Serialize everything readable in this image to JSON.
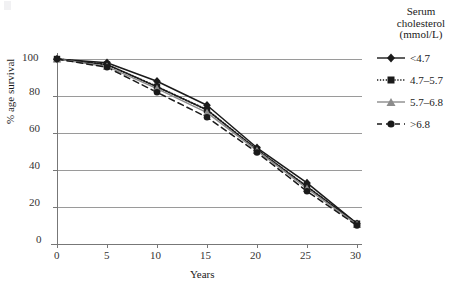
{
  "chart_data": {
    "type": "line",
    "title": "",
    "subtitle": "",
    "xlabel": "Years",
    "ylabel": "% age survival",
    "x": [
      0,
      5,
      10,
      15,
      20,
      25,
      30
    ],
    "xlim": [
      0,
      30
    ],
    "ylim": [
      0,
      100
    ],
    "xticks": [
      "0",
      "5",
      "10",
      "15",
      "20",
      "25",
      "30"
    ],
    "yticks": [
      "0",
      "20",
      "40",
      "60",
      "80",
      "100"
    ],
    "grid": "horizontal",
    "legend_position": "right",
    "legend_title": [
      "Serum",
      "cholesterol",
      "(mmol/L)"
    ],
    "series": [
      {
        "name": "<4.7",
        "marker": "diamond",
        "line_style": "solid",
        "color": "#1a1a1a",
        "values": [
          100,
          98,
          88,
          75,
          52,
          33,
          11
        ]
      },
      {
        "name": "4.7–5.7",
        "marker": "square",
        "line_style": "dotted",
        "color": "#1a1a1a",
        "values": [
          100,
          97,
          85,
          72.5,
          51,
          31,
          11
        ]
      },
      {
        "name": "5.7–6.8",
        "marker": "triangle",
        "line_style": "solid",
        "color": "#8c8c8c",
        "values": [
          100,
          96,
          84,
          71,
          50.5,
          30,
          10.5
        ]
      },
      {
        "name": ">6.8",
        "marker": "circle",
        "line_style": "dashed",
        "color": "#1a1a1a",
        "values": [
          100,
          95.5,
          82,
          68.5,
          49.5,
          28.5,
          10
        ]
      }
    ]
  },
  "axes": {
    "x_title": "Years",
    "y_title": "% age survival",
    "x_tick_labels": [
      "0",
      "5",
      "10",
      "15",
      "20",
      "25",
      "30"
    ],
    "y_tick_labels": [
      "100",
      "80",
      "60",
      "40",
      "20",
      "0"
    ]
  },
  "legend": {
    "title_line1": "Serum",
    "title_line2": "cholesterol",
    "title_line3": "(mmol/L)",
    "entries": [
      {
        "label": "<4.7"
      },
      {
        "label": "4.7–5.7"
      },
      {
        "label": "5.7–6.8"
      },
      {
        "label": ">6.8"
      }
    ]
  },
  "colors": {
    "dark": "#1a1a1a",
    "gray": "#8c8c8c",
    "grid": "#9a9a9a",
    "axis": "#777777"
  }
}
